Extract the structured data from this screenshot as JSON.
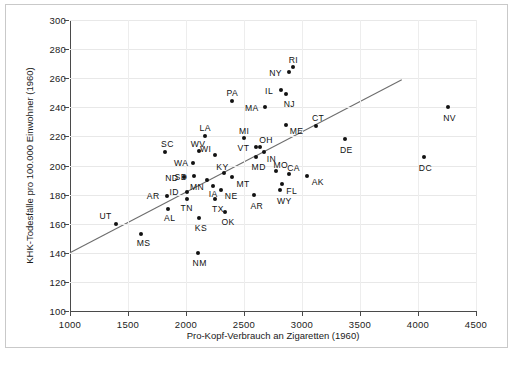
{
  "figure": {
    "background": "#ffffff",
    "frame_color": "#c9c9c9",
    "point_color": "#121212",
    "line_color": "#6d6d6d",
    "grid_color": "#e8e8e8"
  },
  "chart_data": {
    "type": "scatter",
    "title": "",
    "xlabel": "Pro-Kopf-Verbrauch an Zigaretten (1960)",
    "ylabel": "KHK-Todesfälle pro 100.000 Einwohner (1960)",
    "xlim": [
      1000,
      4500
    ],
    "ylim": [
      100,
      300
    ],
    "xticks": [
      1000,
      1500,
      2000,
      2500,
      3000,
      3500,
      4000,
      4500
    ],
    "yticks": [
      100,
      120,
      140,
      160,
      180,
      200,
      220,
      240,
      260,
      280,
      300
    ],
    "grid": true,
    "legend": "none",
    "trendline": {
      "label": "regression line",
      "x_start": 1000,
      "y_start": 140,
      "x_end": 3860,
      "y_end": 259
    },
    "points": [
      {
        "label": "UT",
        "x": 1400,
        "y": 160,
        "lx": -17,
        "ly": -12
      },
      {
        "label": "MS",
        "x": 1610,
        "y": 153,
        "lx": -4,
        "ly": 5
      },
      {
        "label": "SC",
        "x": 1820,
        "y": 209,
        "lx": -4,
        "ly": -12
      },
      {
        "label": "AR",
        "x": 1835,
        "y": 179,
        "lx": -20,
        "ly": -4
      },
      {
        "label": "AL",
        "x": 1845,
        "y": 170,
        "lx": -4,
        "ly": 5
      },
      {
        "label": "ND",
        "x": 1985,
        "y": 192,
        "lx": -19,
        "ly": -3
      },
      {
        "label": "ID",
        "x": 2005,
        "y": 182,
        "lx": -17,
        "ly": -4
      },
      {
        "label": "TN",
        "x": 2005,
        "y": 177,
        "lx": -6,
        "ly": 5
      },
      {
        "label": "WA",
        "x": 2060,
        "y": 202,
        "lx": -19,
        "ly": -4
      },
      {
        "label": "SD",
        "x": 2065,
        "y": 193,
        "lx": -19,
        "ly": -3
      },
      {
        "label": "NM",
        "x": 2100,
        "y": 140,
        "lx": -5,
        "ly": 6
      },
      {
        "label": "WV",
        "x": 2110,
        "y": 210,
        "lx": -8,
        "ly": -11
      },
      {
        "label": "KS",
        "x": 2110,
        "y": 164,
        "lx": -4,
        "ly": 6
      },
      {
        "label": "LA",
        "x": 2160,
        "y": 220,
        "lx": -5,
        "ly": -12
      },
      {
        "label": "MN",
        "x": 2180,
        "y": 190,
        "lx": -17,
        "ly": 3
      },
      {
        "label": "IA",
        "x": 2230,
        "y": 186,
        "lx": -4,
        "ly": 4
      },
      {
        "label": "WI",
        "x": 2250,
        "y": 207,
        "lx": -15,
        "ly": -10
      },
      {
        "label": "TX",
        "x": 2250,
        "y": 177,
        "lx": -3,
        "ly": 6
      },
      {
        "label": "NE",
        "x": 2300,
        "y": 183,
        "lx": 4,
        "ly": 2
      },
      {
        "label": "KY",
        "x": 2330,
        "y": 195,
        "lx": -8,
        "ly": -10
      },
      {
        "label": "OK",
        "x": 2340,
        "y": 168,
        "lx": -4,
        "ly": 6
      },
      {
        "label": "PA",
        "x": 2400,
        "y": 244,
        "lx": -6,
        "ly": -12
      },
      {
        "label": "MT",
        "x": 2400,
        "y": 192,
        "lx": 4,
        "ly": 3
      },
      {
        "label": "MI",
        "x": 2500,
        "y": 219,
        "lx": -5,
        "ly": -11
      },
      {
        "label": "AR",
        "x": 2590,
        "y": 180,
        "lx": -4,
        "ly": 7
      },
      {
        "label": "VT",
        "x": 2600,
        "y": 213,
        "lx": -18,
        "ly": -3
      },
      {
        "label": "MD",
        "x": 2600,
        "y": 206,
        "lx": -4,
        "ly": 6
      },
      {
        "label": "OH",
        "x": 2640,
        "y": 213,
        "lx": -1,
        "ly": -11
      },
      {
        "label": "IN",
        "x": 2670,
        "y": 209,
        "lx": 3,
        "ly": 3
      },
      {
        "label": "MA",
        "x": 2680,
        "y": 240,
        "lx": -20,
        "ly": -3
      },
      {
        "label": "MO",
        "x": 2780,
        "y": 196,
        "lx": -3,
        "ly": -10
      },
      {
        "label": "WY",
        "x": 2810,
        "y": 183,
        "lx": -3,
        "ly": 7
      },
      {
        "label": "IL",
        "x": 2820,
        "y": 252,
        "lx": -16,
        "ly": -3
      },
      {
        "label": "FL",
        "x": 2830,
        "y": 187,
        "lx": 4,
        "ly": 3
      },
      {
        "label": "NJ",
        "x": 2860,
        "y": 249,
        "lx": -2,
        "ly": 6
      },
      {
        "label": "ME",
        "x": 2860,
        "y": 228,
        "lx": 4,
        "ly": 2
      },
      {
        "label": "NY",
        "x": 2890,
        "y": 264,
        "lx": -20,
        "ly": -3
      },
      {
        "label": "CA",
        "x": 2890,
        "y": 194,
        "lx": -2,
        "ly": -10
      },
      {
        "label": "RI",
        "x": 2920,
        "y": 268,
        "lx": -4,
        "ly": -11
      },
      {
        "label": "AK",
        "x": 3040,
        "y": 193,
        "lx": 5,
        "ly": 2
      },
      {
        "label": "CT",
        "x": 3120,
        "y": 227,
        "lx": -4,
        "ly": -12
      },
      {
        "label": "DE",
        "x": 3370,
        "y": 218,
        "lx": -5,
        "ly": 7
      },
      {
        "label": "DC",
        "x": 4050,
        "y": 206,
        "lx": -5,
        "ly": 7
      },
      {
        "label": "NV",
        "x": 4260,
        "y": 240,
        "lx": -5,
        "ly": 7
      }
    ]
  }
}
